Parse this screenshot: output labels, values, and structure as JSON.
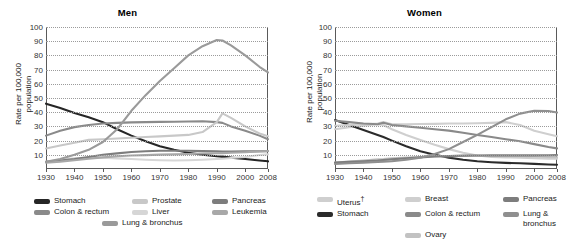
{
  "chart_data": [
    {
      "type": "line",
      "title": "Men",
      "xlabel": "",
      "ylabel": "Rate per 100,000 population",
      "xlim": [
        1930,
        2008
      ],
      "ylim": [
        0,
        100
      ],
      "grid": true,
      "legend_position": "bottom",
      "xticks": [
        "1930",
        "1940",
        "1950",
        "1960",
        "1970",
        "1980",
        "1990",
        "2000",
        "2008"
      ],
      "yticks": [
        "10",
        "20",
        "30",
        "40",
        "50",
        "60",
        "70",
        "80",
        "90",
        "100"
      ],
      "x": [
        1930,
        1935,
        1940,
        1945,
        1950,
        1955,
        1960,
        1965,
        1970,
        1975,
        1980,
        1985,
        1990,
        1992,
        1995,
        2000,
        2005,
        2008
      ],
      "series": [
        {
          "name": "Stomach",
          "color": "#262626",
          "values": [
            46.0,
            43.0,
            39.5,
            36.5,
            33.0,
            28.0,
            23.5,
            19.5,
            16.0,
            13.5,
            11.5,
            10.0,
            9.0,
            8.7,
            8.0,
            7.0,
            6.0,
            5.4
          ]
        },
        {
          "name": "Colon & rectum",
          "color": "#8a8a8a",
          "values": [
            23.5,
            27.0,
            29.5,
            31.0,
            32.0,
            32.5,
            32.8,
            33.0,
            33.2,
            33.3,
            33.5,
            33.6,
            33.0,
            32.5,
            30.0,
            27.0,
            23.5,
            21.0
          ]
        },
        {
          "name": "Prostate",
          "color": "#c8c8c8",
          "values": [
            14.5,
            16.5,
            18.5,
            20.5,
            21.0,
            21.5,
            22.0,
            22.5,
            23.0,
            23.5,
            24.0,
            26.0,
            33.0,
            39.2,
            36.0,
            30.0,
            25.0,
            23.0
          ]
        },
        {
          "name": "Liver",
          "color": "#d6d6d6",
          "values": [
            5.0,
            6.5,
            7.5,
            8.0,
            8.0,
            7.5,
            7.0,
            6.5,
            6.2,
            6.0,
            6.2,
            6.5,
            7.0,
            7.2,
            7.8,
            8.5,
            9.8,
            10.4
          ]
        },
        {
          "name": "Pancreas",
          "color": "#7d7d7d",
          "values": [
            5.0,
            6.0,
            7.0,
            8.5,
            10.0,
            11.0,
            12.0,
            12.5,
            12.8,
            12.9,
            12.8,
            12.6,
            12.4,
            12.3,
            12.3,
            12.4,
            12.5,
            12.6
          ]
        },
        {
          "name": "Leukemia",
          "color": "#a8a8a8",
          "values": [
            4.5,
            5.2,
            6.2,
            7.2,
            8.2,
            9.0,
            9.5,
            9.8,
            10.1,
            10.3,
            10.6,
            10.9,
            11.1,
            11.2,
            11.4,
            11.8,
            12.3,
            12.7
          ]
        },
        {
          "name": "Lung & bronchus",
          "color": "#9a9a9a",
          "values": [
            5.0,
            7.0,
            10.0,
            13.5,
            19.0,
            28.0,
            41.0,
            52.0,
            62.0,
            71.0,
            80.0,
            86.5,
            90.8,
            90.5,
            87.0,
            80.0,
            72.0,
            68.0
          ]
        }
      ]
    },
    {
      "type": "line",
      "title": "Women",
      "xlabel": "",
      "ylabel": "Rate per 100,000 population",
      "xlim": [
        1930,
        2008
      ],
      "ylim": [
        0,
        100
      ],
      "grid": true,
      "legend_position": "bottom",
      "xticks": [
        "1930",
        "1940",
        "1950",
        "1960",
        "1970",
        "1980",
        "1990",
        "2000",
        "2008"
      ],
      "yticks": [
        "10",
        "20",
        "30",
        "40",
        "50",
        "60",
        "70",
        "80",
        "90",
        "100"
      ],
      "x": [
        1930,
        1935,
        1940,
        1945,
        1947,
        1950,
        1955,
        1960,
        1965,
        1970,
        1975,
        1980,
        1985,
        1990,
        1995,
        2000,
        2005,
        2008
      ],
      "series": [
        {
          "name": "Uterus",
          "color": "#cfcfcf",
          "values": [
            28.0,
            29.5,
            30.5,
            31.5,
            31.0,
            28.0,
            24.0,
            20.5,
            17.0,
            14.0,
            11.5,
            9.5,
            8.5,
            8.2,
            8.0,
            7.6,
            7.3,
            7.2
          ]
        },
        {
          "name": "Stomach",
          "color": "#2b2b2b",
          "values": [
            34.5,
            31.0,
            27.5,
            24.0,
            22.5,
            20.0,
            16.0,
            12.5,
            10.0,
            8.0,
            6.5,
            5.5,
            4.8,
            4.3,
            4.0,
            3.6,
            3.2,
            3.0
          ]
        },
        {
          "name": "Breast",
          "color": "#cfcfcf",
          "values": [
            30.5,
            31.0,
            31.5,
            32.0,
            33.0,
            31.5,
            31.5,
            31.7,
            31.8,
            32.0,
            32.0,
            32.2,
            32.5,
            33.0,
            31.0,
            27.0,
            24.5,
            23.0
          ]
        },
        {
          "name": "Colon & rectum",
          "color": "#8a8a8a",
          "values": [
            34.0,
            33.0,
            32.0,
            31.5,
            32.5,
            31.0,
            30.0,
            29.0,
            28.0,
            27.0,
            25.5,
            24.0,
            22.5,
            21.0,
            19.5,
            17.5,
            15.5,
            14.5
          ]
        },
        {
          "name": "Ovary",
          "color": "#c2c2c2",
          "values": [
            4.5,
            5.2,
            6.0,
            6.8,
            7.0,
            7.5,
            8.0,
            8.4,
            8.8,
            9.0,
            9.2,
            9.3,
            9.2,
            9.1,
            9.0,
            8.8,
            8.5,
            8.3
          ]
        },
        {
          "name": "Pancreas",
          "color": "#7d7d7d",
          "values": [
            4.5,
            5.0,
            5.5,
            6.0,
            6.3,
            6.8,
            7.6,
            8.2,
            8.8,
            9.2,
            9.4,
            9.5,
            9.6,
            9.6,
            9.6,
            9.6,
            9.7,
            9.8
          ]
        },
        {
          "name": "Lung & bronchus",
          "color": "#8f8f8f",
          "values": [
            3.5,
            4.0,
            4.5,
            5.0,
            5.2,
            5.5,
            6.5,
            8.0,
            10.5,
            14.0,
            19.0,
            24.0,
            29.5,
            35.0,
            39.0,
            41.0,
            40.8,
            39.8
          ]
        }
      ]
    }
  ],
  "men": {
    "title": "Men",
    "ylabel_line1": "Rate per 100,000",
    "ylabel_line2": "population",
    "legend": {
      "col1": [
        {
          "label": "Stomach",
          "color": "#262626"
        },
        {
          "label": "Colon & rectum",
          "color": "#8a8a8a"
        }
      ],
      "col2": [
        {
          "label": "Prostate",
          "color": "#c8c8c8"
        },
        {
          "label": "Liver",
          "color": "#d6d6d6"
        }
      ],
      "col3": [
        {
          "label": "Pancreas",
          "color": "#7d7d7d"
        },
        {
          "label": "Leukemia",
          "color": "#a8a8a8"
        }
      ],
      "center": {
        "label": "Lung & bronchus",
        "color": "#9a9a9a"
      }
    }
  },
  "women": {
    "title": "Women",
    "ylabel_line1": "Rate per 100,000",
    "ylabel_line2": "population",
    "legend": {
      "col1": [
        {
          "label": "Uterus",
          "dagger": "†",
          "color": "#cfcfcf"
        },
        {
          "label": "Stomach",
          "color": "#2b2b2b"
        }
      ],
      "col2": [
        {
          "label": "Breast",
          "color": "#cfcfcf"
        },
        {
          "label": "Colon & rectum",
          "color": "#8a8a8a"
        },
        {
          "label": "Ovary",
          "color": "#c2c2c2"
        }
      ],
      "col3": [
        {
          "label": "Pancreas",
          "color": "#7d7d7d"
        },
        {
          "label": "Lung & bronchus",
          "color": "#8f8f8f"
        }
      ]
    }
  }
}
